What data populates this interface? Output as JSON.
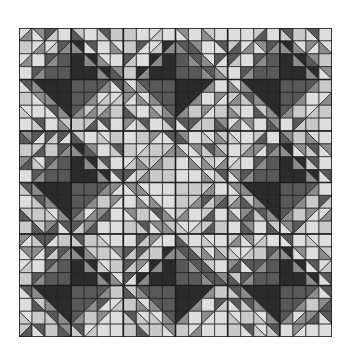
{
  "image": {
    "subject": "grayscale quilt pattern",
    "grid": {
      "cols": 24,
      "rows": 24
    },
    "units": {
      "cols": 3,
      "rows": 3
    },
    "palette": {
      "vdark": "#2b2b2b",
      "dark": "#585858",
      "mid": "#8c8c8c",
      "light": "#c9c9c9",
      "vlight": "#dedede",
      "line": "#1e1e1e"
    },
    "unit_centers": [
      [
        "dark",
        "vdark",
        "dark"
      ],
      [
        "dark",
        "light",
        "dark"
      ],
      [
        "dark",
        "vdark",
        "dark"
      ]
    ]
  }
}
